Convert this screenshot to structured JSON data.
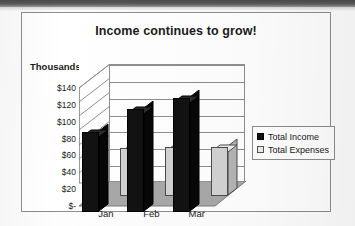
{
  "chart_data": {
    "type": "bar",
    "title": "Income continues to grow!",
    "xlabel": "",
    "ylabel": "Thousands",
    "categories": [
      "Jan",
      "Feb",
      "Mar"
    ],
    "series": [
      {
        "name": "Total Income",
        "values": [
          95,
          122,
          135
        ],
        "color": "#121212"
      },
      {
        "name": "Total Expenses",
        "values": [
          57,
          58,
          58
        ],
        "color": "#d2d2d2"
      }
    ],
    "ylim": [
      0,
      140
    ],
    "yticks": [
      "$140",
      "$120",
      "$100",
      "$80",
      "$60",
      "$40",
      "$20",
      "$-"
    ],
    "ytick_values": [
      140,
      120,
      100,
      80,
      60,
      40,
      20,
      0
    ],
    "grid": true,
    "legend_position": "right",
    "style_3d": true
  },
  "legend": {
    "items": [
      {
        "label": "Total Income",
        "swatch": "black-square-icon"
      },
      {
        "label": "Total Expenses",
        "swatch": "light-square-icon"
      }
    ]
  },
  "colors": {
    "income": "#121212",
    "expenses": "#d2d2d2",
    "frame": "#8d8d8d",
    "floor": "#a8a8a8",
    "gridline": "#8f8f8f",
    "text": "#1a1a1a"
  }
}
